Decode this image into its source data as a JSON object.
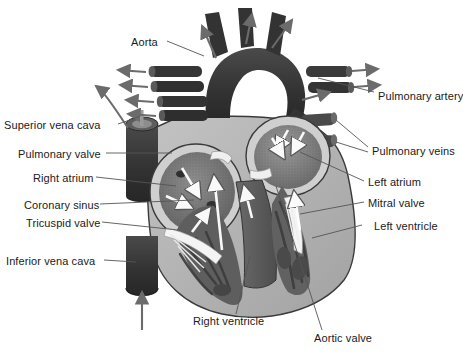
{
  "figure": {
    "kind": "anatomical-illustration",
    "background_color": "#ffffff",
    "label_color": "#1a1a1a",
    "leader_line_color": "#555555"
  },
  "palette": {
    "vessel_dark": "#3b3b3b",
    "vessel_dark2": "#2f2f2f",
    "myocardium_light": "#b9b9b9",
    "myocardium_mid": "#9a9a9a",
    "chamber_wall": "#cfcfcf",
    "chamber_fill_dark": "#6e6e6e",
    "chamber_fill_mid": "#7d7d7d",
    "trabeculae": "#4a4a4a",
    "lumen_white": "#f2f2f2",
    "flow_arrow_white": "#ffffff",
    "flow_arrow_gray": "#6b6b6b",
    "outline": "#3a3a3a"
  },
  "labels_left": [
    {
      "id": "superior-vena-cava",
      "text": "Superior vena cava",
      "x": 4,
      "y": 119
    },
    {
      "id": "pulmonary-valve",
      "text": "Pulmonary valve",
      "x": 18,
      "y": 150
    },
    {
      "id": "right-atrium",
      "text": "Right atrium",
      "x": 33,
      "y": 174
    },
    {
      "id": "coronary-sinus",
      "text": "Coronary sinus",
      "x": 24,
      "y": 201
    },
    {
      "id": "tricuspid-valve",
      "text": "Tricuspid valve",
      "x": 26,
      "y": 219
    },
    {
      "id": "inferior-vena-cava",
      "text": "Inferior vena cava",
      "x": 6,
      "y": 258
    }
  ],
  "labels_right": [
    {
      "id": "pulmonary-artery",
      "text": "Pulmonary artery",
      "x": 378,
      "y": 95
    },
    {
      "id": "pulmonary-veins",
      "text": "Pulmonary veins",
      "x": 372,
      "y": 150
    },
    {
      "id": "left-atrium",
      "text": "Left atrium",
      "x": 368,
      "y": 179
    },
    {
      "id": "mitral-valve",
      "text": "Mitral valve",
      "x": 368,
      "y": 200
    },
    {
      "id": "left-ventricle",
      "text": "Left ventricle",
      "x": 374,
      "y": 223
    }
  ],
  "labels_other": [
    {
      "id": "aorta",
      "text": "Aorta",
      "x": 131,
      "y": 40
    },
    {
      "id": "right-ventricle",
      "text": "Right ventricle",
      "x": 193,
      "y": 318
    },
    {
      "id": "aortic-valve",
      "text": "Aortic valve",
      "x": 314,
      "y": 335
    }
  ],
  "structures": [
    "aortic arch with three brachiocephalic branches",
    "superior vena cava",
    "inferior vena cava",
    "right atrium",
    "right ventricle",
    "left atrium",
    "left ventricle",
    "tricuspid valve",
    "mitral valve",
    "aortic valve",
    "pulmonary valve",
    "pulmonary artery",
    "pulmonary veins",
    "coronary sinus",
    "papillary muscles and chordae tendineae"
  ],
  "flow_arrows": {
    "white_interior_count": 9,
    "gray_exterior_count": 12,
    "description": "White arrows show blood flow through chambers and valves; gray arrows show flow entering and leaving the great vessels."
  }
}
